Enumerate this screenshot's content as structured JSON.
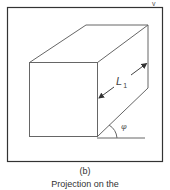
{
  "figure": {
    "top_marker": "v",
    "dimension_label": "L",
    "dimension_subscript": "1",
    "angle_label": "φ",
    "caption_label": "(b)",
    "caption_text": "Projection on the"
  },
  "colors": {
    "line": "#555555",
    "frame": "#333333",
    "background": "#ffffff"
  }
}
